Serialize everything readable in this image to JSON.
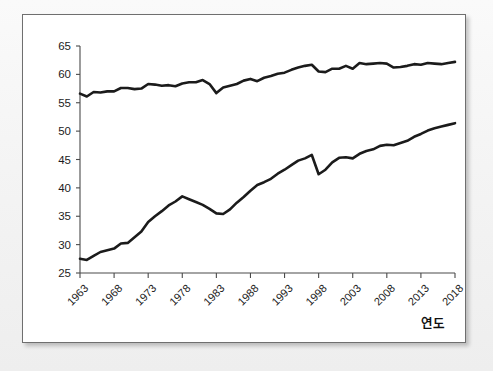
{
  "chart_data": {
    "type": "line",
    "title": "",
    "xlabel": "연도",
    "ylabel": "",
    "grid": false,
    "legend": "none",
    "xlim": [
      1963,
      2018
    ],
    "ylim": [
      25,
      65
    ],
    "ytick_labels": [
      "65",
      "60",
      "55",
      "50",
      "45",
      "40",
      "35",
      "30",
      "25"
    ],
    "ytick_values": [
      65,
      60,
      55,
      50,
      45,
      40,
      35,
      30,
      25
    ],
    "xtick_labels": [
      "1963",
      "1968",
      "1973",
      "1978",
      "1983",
      "1988",
      "1993",
      "1998",
      "2003",
      "2008",
      "2013",
      "2018"
    ],
    "xtick_values": [
      1963,
      1968,
      1973,
      1978,
      1983,
      1988,
      1993,
      1998,
      2003,
      2008,
      2013,
      2018
    ],
    "x": [
      1963,
      1964,
      1965,
      1966,
      1967,
      1968,
      1969,
      1970,
      1971,
      1972,
      1973,
      1974,
      1975,
      1976,
      1977,
      1978,
      1979,
      1980,
      1981,
      1982,
      1983,
      1984,
      1985,
      1986,
      1987,
      1988,
      1989,
      1990,
      1991,
      1992,
      1993,
      1994,
      1995,
      1996,
      1997,
      1998,
      1999,
      2000,
      2001,
      2002,
      2003,
      2004,
      2005,
      2006,
      2007,
      2008,
      2009,
      2010,
      2011,
      2012,
      2013,
      2014,
      2015,
      2016,
      2017,
      2018
    ],
    "series": [
      {
        "name": "upper-series",
        "values": [
          56.6,
          56.1,
          56.9,
          56.8,
          57.0,
          57.0,
          57.6,
          57.6,
          57.4,
          57.5,
          58.3,
          58.2,
          58.0,
          58.1,
          57.9,
          58.4,
          58.6,
          58.6,
          59.0,
          58.3,
          56.7,
          57.7,
          58.0,
          58.3,
          58.9,
          59.2,
          58.8,
          59.4,
          59.7,
          60.1,
          60.3,
          60.8,
          61.2,
          61.5,
          61.7,
          60.5,
          60.4,
          61.0,
          61.0,
          61.5,
          61.0,
          62.0,
          61.8,
          61.9,
          62.0,
          61.9,
          61.2,
          61.3,
          61.5,
          61.8,
          61.7,
          62.0,
          61.9,
          61.8,
          62.0,
          62.2
        ]
      },
      {
        "name": "lower-series",
        "values": [
          27.5,
          27.3,
          28.0,
          28.7,
          29.0,
          29.3,
          30.2,
          30.3,
          31.3,
          32.3,
          34.0,
          35.0,
          35.9,
          36.9,
          37.6,
          38.5,
          38.0,
          37.5,
          37.0,
          36.3,
          35.5,
          35.4,
          36.2,
          37.4,
          38.4,
          39.5,
          40.5,
          41.0,
          41.6,
          42.5,
          43.2,
          44.0,
          44.8,
          45.2,
          45.8,
          42.4,
          43.2,
          44.5,
          45.3,
          45.4,
          45.2,
          46.0,
          46.5,
          46.8,
          47.4,
          47.6,
          47.5,
          47.9,
          48.3,
          49.0,
          49.5,
          50.1,
          50.5,
          50.8,
          51.1,
          51.4
        ]
      }
    ]
  },
  "frame": {
    "card_name": "chart-card"
  }
}
